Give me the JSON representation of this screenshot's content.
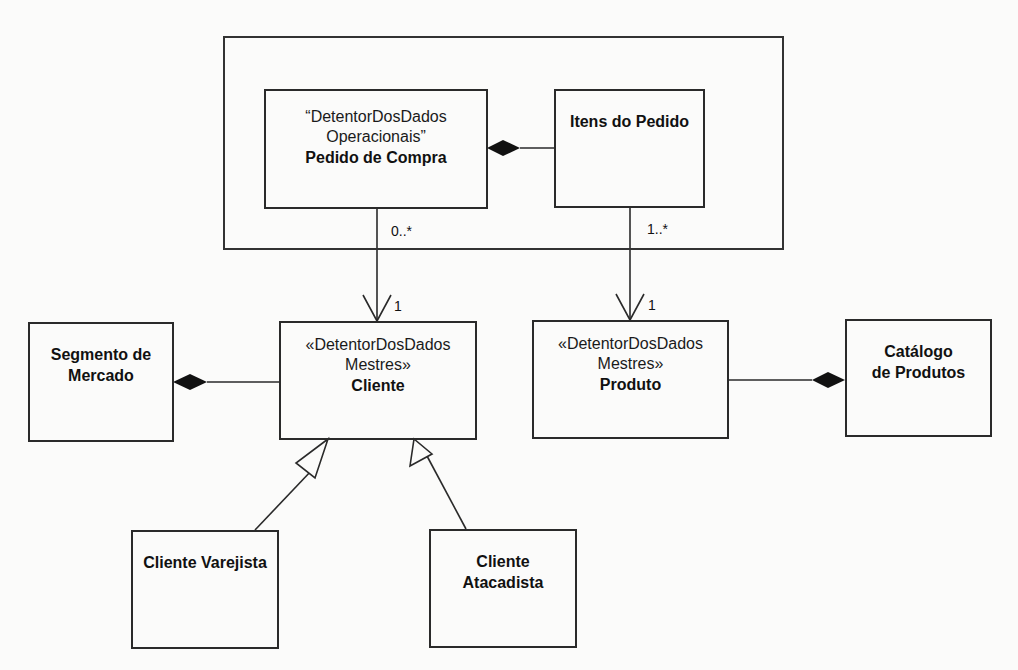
{
  "diagram": {
    "type": "UML class diagram",
    "package": {
      "label": ""
    },
    "classes": {
      "pedido": {
        "stereotype_line1": "“DetentorDosDados",
        "stereotype_line2": "Operacionais”",
        "name": "Pedido de Compra"
      },
      "itens": {
        "name": "Itens do Pedido"
      },
      "segmento": {
        "name_line1": "Segmento de",
        "name_line2": "Mercado"
      },
      "cliente": {
        "stereotype_line1": "«DetentorDosDados",
        "stereotype_line2": "Mestres»",
        "name": "Cliente"
      },
      "produto": {
        "stereotype_line1": "«DetentorDosDados",
        "stereotype_line2": "Mestres»",
        "name": "Produto"
      },
      "catalogo": {
        "name_line1": "Catálogo",
        "name_line2": "de Produtos"
      },
      "varejista": {
        "name": "Cliente Varejista"
      },
      "atacadista": {
        "name_line1": "Cliente",
        "name_line2": "Atacadista"
      }
    },
    "relationships": [
      {
        "from": "Itens do Pedido",
        "to": "Pedido de Compra",
        "kind": "composition"
      },
      {
        "from": "Pedido de Compra",
        "to": "Cliente",
        "kind": "directed-association",
        "source_mult": "0..*",
        "target_mult": "1"
      },
      {
        "from": "Itens do Pedido",
        "to": "Produto",
        "kind": "directed-association",
        "source_mult": "1..*",
        "target_mult": "1"
      },
      {
        "from": "Cliente",
        "to": "Segmento de Mercado",
        "kind": "composition"
      },
      {
        "from": "Produto",
        "to": "Catálogo de Produtos",
        "kind": "composition"
      },
      {
        "from": "Cliente Varejista",
        "to": "Cliente",
        "kind": "generalization"
      },
      {
        "from": "Cliente Atacadista",
        "to": "Cliente",
        "kind": "generalization"
      }
    ],
    "multiplicities": {
      "pedido_source": "0..*",
      "cliente_target": "1",
      "itens_source": "1..*",
      "produto_target": "1"
    },
    "colors": {
      "line": "#2a2a2a",
      "background": "#fbfbfa",
      "diamond_fill": "#111111"
    }
  }
}
